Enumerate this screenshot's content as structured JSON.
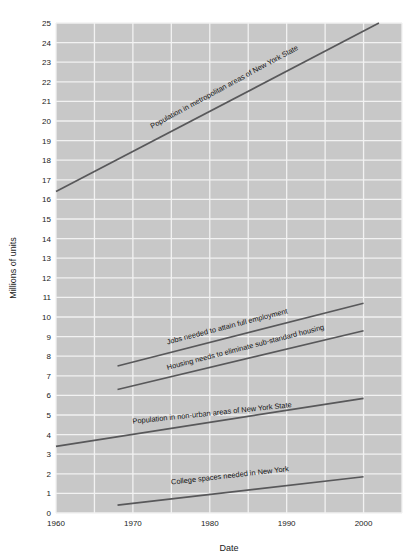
{
  "chart_data": {
    "type": "line",
    "title": "",
    "xlabel": "Date",
    "ylabel": "Millions of units",
    "xlim": [
      1960,
      2005
    ],
    "ylim": [
      0,
      25
    ],
    "grid": true,
    "legend_position": "inline-labels",
    "x_ticks": [
      "1960",
      "1970",
      "1980",
      "1990",
      "2000"
    ],
    "x_tick_values": [
      1960,
      1970,
      1980,
      1990,
      2000
    ],
    "y_ticks": [
      "0",
      "1",
      "2",
      "3",
      "4",
      "5",
      "6",
      "7",
      "8",
      "9",
      "10",
      "11",
      "12",
      "13",
      "14",
      "15",
      "16",
      "17",
      "18",
      "19",
      "20",
      "21",
      "22",
      "23",
      "24",
      "25"
    ],
    "y_tick_values": [
      0,
      1,
      2,
      3,
      4,
      5,
      6,
      7,
      8,
      9,
      10,
      11,
      12,
      13,
      14,
      15,
      16,
      17,
      18,
      19,
      20,
      21,
      22,
      23,
      24,
      25
    ],
    "series": [
      {
        "name": "Population in metropolitan areas of New York State",
        "x": [
          1960,
          2002
        ],
        "values": [
          16.4,
          25.0
        ],
        "label_x": 1972.5,
        "label_y": 19.6,
        "label_angle": -28.5
      },
      {
        "name": "Jobs needed to attain full employment",
        "x": [
          1968,
          2000
        ],
        "values": [
          7.5,
          10.7
        ],
        "label_x": 1974.5,
        "label_y": 8.6,
        "label_angle": -14.5
      },
      {
        "name": "Housing needs to eliminate sub-standard housing",
        "x": [
          1968,
          2000
        ],
        "values": [
          6.3,
          9.3
        ],
        "label_x": 1974.5,
        "label_y": 7.3,
        "label_angle": -14.5
      },
      {
        "name": "Population in non-urban areas of New York State",
        "x": [
          1960,
          2000
        ],
        "values": [
          3.4,
          5.85
        ],
        "label_x": 1970.0,
        "label_y": 4.55,
        "label_angle": -6.0
      },
      {
        "name": "College spaces needed in New York",
        "x": [
          1968,
          2000
        ],
        "values": [
          0.4,
          1.85
        ],
        "label_x": 1975.0,
        "label_y": 1.45,
        "label_angle": -6.5
      }
    ],
    "colors": {
      "plot_background": "#c8c8c8",
      "grid": "#f2f2f2",
      "line": "#58585a",
      "text": "#1b1b1b",
      "page_background": "#ffffff"
    }
  }
}
